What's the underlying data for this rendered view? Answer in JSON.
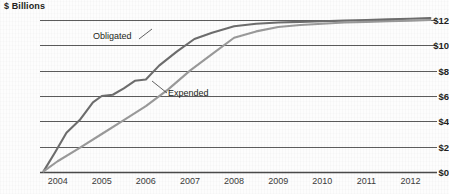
{
  "chart": {
    "axis_title": "$ Billions",
    "plot": {
      "left_px": 40,
      "right_px": 437,
      "top_px": 20,
      "bottom_px": 172
    }
  },
  "chart_data": {
    "type": "line",
    "title": "",
    "subtitle": "",
    "xlabel": "",
    "ylabel": "$ Billions",
    "ylim": [
      0,
      12
    ],
    "xlim": [
      2003.6,
      2012.6
    ],
    "grid": "horizontal",
    "legend": "inline-annotations",
    "y_ticks": [
      {
        "value": 0,
        "label": "$0"
      },
      {
        "value": 2,
        "label": "$2"
      },
      {
        "value": 4,
        "label": "$4"
      },
      {
        "value": 6,
        "label": "$6"
      },
      {
        "value": 8,
        "label": "$8"
      },
      {
        "value": 10,
        "label": "$10"
      },
      {
        "value": 12,
        "label": "$12"
      }
    ],
    "x_ticks": [
      {
        "value": 2004,
        "label": "2004"
      },
      {
        "value": 2005,
        "label": "2005"
      },
      {
        "value": 2006,
        "label": "2006"
      },
      {
        "value": 2007,
        "label": "2007"
      },
      {
        "value": 2008,
        "label": "2008"
      },
      {
        "value": 2009,
        "label": "2009"
      },
      {
        "value": 2010,
        "label": "2010"
      },
      {
        "value": 2011,
        "label": "2011"
      },
      {
        "value": 2012,
        "label": "2012"
      }
    ],
    "annotations": [
      {
        "text": "Obligated",
        "series": "Obligated",
        "x": 2005.1,
        "y": 11.3
      },
      {
        "text": "Expended",
        "series": "Expended",
        "x": 2006.6,
        "y": 5.9
      }
    ],
    "series": [
      {
        "name": "Obligated",
        "color": "#6d6d6d",
        "x": [
          2003.68,
          2003.95,
          2004.2,
          2004.5,
          2004.8,
          2005.0,
          2005.25,
          2005.5,
          2005.75,
          2006.0,
          2006.3,
          2006.7,
          2007.1,
          2007.5,
          2008.0,
          2008.5,
          2009.0,
          2009.5,
          2010.0,
          2010.5,
          2011.0,
          2011.5,
          2012.0,
          2012.45
        ],
        "y": [
          0.05,
          1.6,
          3.1,
          4.1,
          5.5,
          6.0,
          6.1,
          6.6,
          7.2,
          7.3,
          8.4,
          9.5,
          10.5,
          11.0,
          11.5,
          11.7,
          11.8,
          11.85,
          11.9,
          11.95,
          12.0,
          12.05,
          12.1,
          12.15
        ]
      },
      {
        "name": "Expended",
        "color": "#9a9a9a",
        "x": [
          2003.68,
          2004.0,
          2004.5,
          2005.0,
          2005.5,
          2006.0,
          2006.5,
          2007.0,
          2007.5,
          2008.0,
          2008.5,
          2009.0,
          2009.5,
          2010.0,
          2010.5,
          2011.0,
          2011.5,
          2012.0,
          2012.45
        ],
        "y": [
          0.05,
          0.85,
          1.9,
          3.0,
          4.1,
          5.2,
          6.5,
          8.0,
          9.3,
          10.6,
          11.1,
          11.45,
          11.6,
          11.7,
          11.8,
          11.85,
          11.9,
          11.95,
          12.0
        ]
      }
    ]
  }
}
